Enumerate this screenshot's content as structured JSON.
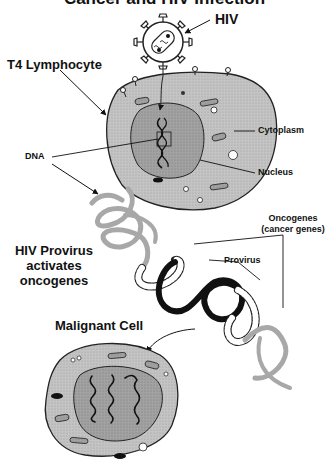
{
  "title": {
    "text": "Cancer and HIV Infection",
    "cut_off": true
  },
  "labels": {
    "hiv": "HIV",
    "t4": "T4 Lymphocyte",
    "cytoplasm": "Cytoplasm",
    "dna": "DNA",
    "nucleus": "Nucleus",
    "oncogenes_1": "Oncogenes",
    "oncogenes_2": "(cancer genes)",
    "provirus": "Provirus",
    "hiv_provirus_1": "HIV Provirus",
    "hiv_provirus_2": "activates",
    "hiv_provirus_3": "oncogenes",
    "malignant": "Malignant Cell"
  },
  "colors": {
    "cytoplasm": "#bdbdbd",
    "nucleus": "#9a9a9a",
    "dna_strand": "#a8a8a8",
    "provirus_strand": "#1a1a1a",
    "oncogene_strand": "#ffffff",
    "outline": "#222222"
  }
}
